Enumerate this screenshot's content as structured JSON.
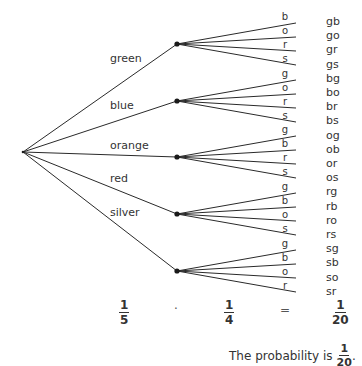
{
  "diagram": {
    "type": "tree-diagram",
    "first_stage": {
      "root": {
        "x": 23,
        "y": 152
      },
      "branches": [
        {
          "label": "green",
          "node": {
            "x": 177,
            "y": 44
          },
          "label_pos": {
            "x": 110,
            "y": 53
          }
        },
        {
          "label": "blue",
          "node": {
            "x": 177,
            "y": 101
          },
          "label_pos": {
            "x": 110,
            "y": 100
          }
        },
        {
          "label": "orange",
          "node": {
            "x": 177,
            "y": 157
          },
          "label_pos": {
            "x": 110,
            "y": 140
          }
        },
        {
          "label": "red",
          "node": {
            "x": 177,
            "y": 214
          },
          "label_pos": {
            "x": 110,
            "y": 173
          }
        },
        {
          "label": "silver",
          "node": {
            "x": 177,
            "y": 271
          },
          "label_pos": {
            "x": 110,
            "y": 207
          }
        }
      ]
    },
    "second_stage": [
      {
        "from": "green",
        "labels": [
          "b",
          "o",
          "r",
          "s"
        ],
        "ends_y": [
          23,
          37,
          51,
          65
        ]
      },
      {
        "from": "blue",
        "labels": [
          "g",
          "o",
          "r",
          "s"
        ],
        "ends_y": [
          80,
          94,
          108,
          122
        ]
      },
      {
        "from": "orange",
        "labels": [
          "g",
          "b",
          "r",
          "s"
        ],
        "ends_y": [
          136,
          150,
          164,
          178
        ]
      },
      {
        "from": "red",
        "labels": [
          "g",
          "b",
          "o",
          "s"
        ],
        "ends_y": [
          193,
          207,
          221,
          235
        ]
      },
      {
        "from": "silver",
        "labels": [
          "g",
          "b",
          "o",
          "r"
        ],
        "ends_y": [
          250,
          264,
          278,
          292
        ]
      }
    ],
    "branch_end_x": 296,
    "outcomes": [
      "gb",
      "go",
      "gr",
      "gs",
      "bg",
      "bo",
      "br",
      "bs",
      "og",
      "ob",
      "or",
      "os",
      "rg",
      "rb",
      "ro",
      "rs",
      "sg",
      "sb",
      "so",
      "sr"
    ],
    "line_color": "#2a2a2a",
    "node_color": "#1a1a1a"
  },
  "equation": {
    "first": {
      "numerator": "1",
      "denominator": "5"
    },
    "operator": "·",
    "second": {
      "numerator": "1",
      "denominator": "4"
    },
    "equals": "=",
    "result": {
      "numerator": "1",
      "denominator": "20"
    }
  },
  "conclusion": {
    "text": "The probability is",
    "fraction": {
      "numerator": "1",
      "denominator": "20"
    },
    "end": "."
  }
}
